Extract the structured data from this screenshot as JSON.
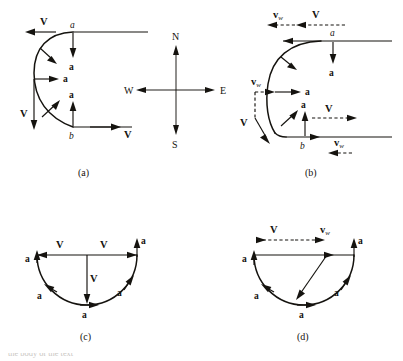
{
  "figure": {
    "vector_labels": {
      "velocity": "V",
      "acceleration": "a",
      "wind_prefix": "v",
      "wind_subscript": "w"
    },
    "point_labels": {
      "a": "a",
      "b": "b"
    },
    "compass": {
      "north": "N",
      "south": "S",
      "east": "E",
      "west": "W"
    },
    "panels": [
      {
        "id": "a",
        "label": "(a)",
        "description": "No-wind turn: velocity V tangent, acceleration a centripetal",
        "vectors": [
          {
            "name": "V",
            "position": "top-left",
            "direction": "west",
            "style": "solid"
          },
          {
            "name": "a",
            "position": "top-center",
            "direction": "south",
            "style": "solid"
          },
          {
            "name": "a",
            "position": "upper-arc",
            "direction": "southeast",
            "style": "solid"
          },
          {
            "name": "a",
            "position": "middle-left",
            "direction": "east",
            "style": "solid"
          },
          {
            "name": "V",
            "position": "left-lower",
            "direction": "south",
            "style": "solid"
          },
          {
            "name": "a",
            "position": "lower-arc",
            "direction": "northeast",
            "style": "solid"
          },
          {
            "name": "a",
            "position": "bottom-center",
            "direction": "north",
            "style": "solid"
          },
          {
            "name": "V",
            "position": "bottom-right",
            "direction": "east",
            "style": "solid"
          }
        ]
      },
      {
        "id": "b",
        "label": "(b)",
        "description": "Turn with wind: wind velocity v_w added to V as dashed vectors",
        "vectors": [
          {
            "name": "v_w",
            "position": "top-outer",
            "direction": "west",
            "style": "dashed"
          },
          {
            "name": "V",
            "position": "top-inner",
            "direction": "west",
            "style": "dashed"
          },
          {
            "name": "a",
            "position": "top-center",
            "direction": "south",
            "style": "solid"
          },
          {
            "name": "a",
            "position": "upper-arc",
            "direction": "southeast",
            "style": "solid"
          },
          {
            "name": "v_w",
            "position": "middle-left",
            "direction": "east",
            "style": "dashed"
          },
          {
            "name": "a",
            "position": "middle-center",
            "direction": "east",
            "style": "solid"
          },
          {
            "name": "V",
            "position": "left-lower",
            "direction": "south",
            "style": "dashed"
          },
          {
            "name": "a",
            "position": "lower-arc",
            "direction": "northeast",
            "style": "solid"
          },
          {
            "name": "a",
            "position": "bottom-center",
            "direction": "north",
            "style": "solid"
          },
          {
            "name": "V",
            "position": "bottom-inner",
            "direction": "east",
            "style": "dashed"
          },
          {
            "name": "v_w",
            "position": "bottom-outer",
            "direction": "west",
            "style": "dashed"
          }
        ]
      },
      {
        "id": "c",
        "label": "(c)",
        "description": "Hodograph semicircle, no wind: V chord vectors and a tangential vectors",
        "vectors": [
          {
            "name": "V",
            "position": "chord-left",
            "direction": "west",
            "style": "solid"
          },
          {
            "name": "V",
            "position": "chord-right",
            "direction": "east",
            "style": "solid"
          },
          {
            "name": "V",
            "position": "center-down",
            "direction": "south",
            "style": "solid"
          },
          {
            "name": "a",
            "position": "arc-top-right",
            "direction": "north",
            "style": "solid"
          },
          {
            "name": "a",
            "position": "arc-top-left",
            "direction": "north",
            "style": "solid"
          },
          {
            "name": "a",
            "position": "arc-lower-right",
            "direction": "northeast",
            "style": "solid"
          },
          {
            "name": "a",
            "position": "arc-lower-left",
            "direction": "southwest",
            "style": "solid"
          },
          {
            "name": "a",
            "position": "arc-bottom",
            "direction": "east",
            "style": "solid"
          }
        ]
      },
      {
        "id": "d",
        "label": "(d)",
        "description": "Hodograph semicircle with wind: displaced center, V and v_w dashed above",
        "vectors": [
          {
            "name": "V",
            "position": "top-left",
            "direction": "east",
            "style": "dashed"
          },
          {
            "name": "v_w",
            "position": "top-right",
            "direction": "east",
            "style": "dashed"
          },
          {
            "name": "a",
            "position": "arc-top-right",
            "direction": "north",
            "style": "solid"
          },
          {
            "name": "a",
            "position": "arc-top-left",
            "direction": "north",
            "style": "solid"
          },
          {
            "name": "a",
            "position": "arc-lower-right",
            "direction": "northeast",
            "style": "solid"
          },
          {
            "name": "a",
            "position": "arc-lower-left",
            "direction": "southwest",
            "style": "solid"
          },
          {
            "name": "a",
            "position": "arc-bottom",
            "direction": "east",
            "style": "solid"
          }
        ]
      }
    ]
  },
  "caption": {
    "text": "the body of the text"
  },
  "colors": {
    "ink": "#15130f",
    "background": "#ffffff"
  }
}
